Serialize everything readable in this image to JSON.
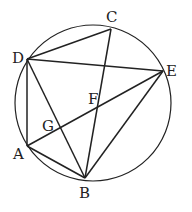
{
  "diagram": {
    "type": "geometry-circle-inscribed-points",
    "circle": {
      "cx": 93,
      "cy": 103,
      "r": 78
    },
    "points": {
      "A": {
        "x": 27,
        "y": 146,
        "label": "A",
        "lx": 13,
        "ly": 159
      },
      "B": {
        "x": 85,
        "y": 178,
        "label": "B",
        "lx": 79,
        "ly": 198
      },
      "C": {
        "x": 111,
        "y": 29,
        "label": "C",
        "lx": 106,
        "ly": 22
      },
      "D": {
        "x": 27,
        "y": 59,
        "label": "D",
        "lx": 12,
        "ly": 63
      },
      "E": {
        "x": 163,
        "y": 71,
        "label": "E",
        "lx": 166,
        "ly": 76
      },
      "F": {
        "x": 99,
        "y": 106,
        "label": "F",
        "lx": 88,
        "ly": 104
      },
      "G": {
        "x": 55,
        "y": 128,
        "label": "G",
        "lx": 42,
        "ly": 131
      }
    },
    "segments": [
      [
        "D",
        "C"
      ],
      [
        "D",
        "E"
      ],
      [
        "D",
        "A"
      ],
      [
        "D",
        "B"
      ],
      [
        "C",
        "B"
      ],
      [
        "A",
        "E"
      ],
      [
        "A",
        "B"
      ],
      [
        "B",
        "E"
      ]
    ],
    "stroke_color": "#222222"
  }
}
